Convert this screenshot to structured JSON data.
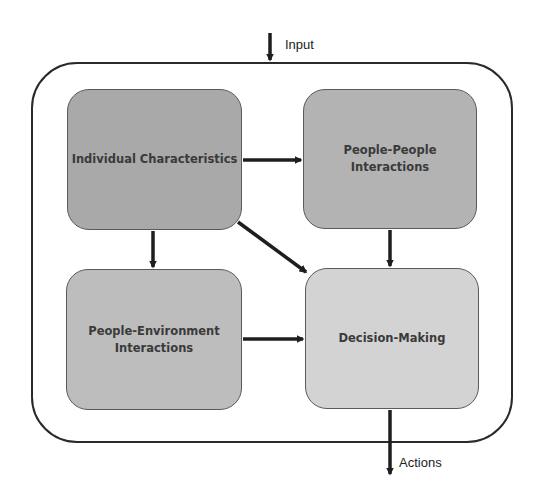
{
  "diagram": {
    "type": "flowchart",
    "input_label": "Input",
    "output_label": "Actions",
    "nodes": [
      {
        "id": "individual",
        "label": "Individual Characteristics",
        "fill": "#a9a9a9"
      },
      {
        "id": "people_people",
        "label": "People-People\nInteractions",
        "fill": "#b3b3b3"
      },
      {
        "id": "people_env",
        "label": "People-Environment\nInteractions",
        "fill": "#bdbdbd"
      },
      {
        "id": "decision",
        "label": "Decision-Making",
        "fill": "#d3d3d3"
      }
    ],
    "edges": [
      {
        "from": "input",
        "to": "container"
      },
      {
        "from": "individual",
        "to": "people_people"
      },
      {
        "from": "individual",
        "to": "people_env"
      },
      {
        "from": "individual",
        "to": "decision"
      },
      {
        "from": "people_people",
        "to": "decision"
      },
      {
        "from": "people_env",
        "to": "decision"
      },
      {
        "from": "decision",
        "to": "actions"
      }
    ],
    "colors": {
      "stroke": "#2a2a2a",
      "arrow": "#1e1e1e",
      "text": "#3a3a3a"
    }
  }
}
